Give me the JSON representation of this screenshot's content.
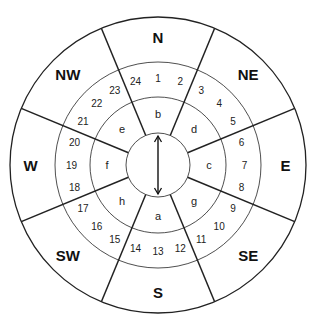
{
  "diagram": {
    "center": {
      "x": 158,
      "y": 165
    },
    "radii": {
      "outer": 148,
      "ring_numbers": 103,
      "ring_letters": 68,
      "inner": 32
    },
    "compass_sectors": [
      {
        "label": "N",
        "angle": 0
      },
      {
        "label": "NE",
        "angle": 45
      },
      {
        "label": "E",
        "angle": 90
      },
      {
        "label": "SE",
        "angle": 135
      },
      {
        "label": "S",
        "angle": 180
      },
      {
        "label": "SW",
        "angle": 225
      },
      {
        "label": "W",
        "angle": 270
      },
      {
        "label": "NW",
        "angle": 315
      }
    ],
    "numbered_positions": [
      "1",
      "2",
      "3",
      "4",
      "5",
      "6",
      "7",
      "8",
      "9",
      "10",
      "11",
      "12",
      "13",
      "14",
      "15",
      "16",
      "17",
      "18",
      "19",
      "20",
      "21",
      "22",
      "23",
      "24"
    ],
    "letter_segments": [
      {
        "label": "b",
        "sector": "N"
      },
      {
        "label": "d",
        "sector": "NE"
      },
      {
        "label": "c",
        "sector": "E"
      },
      {
        "label": "g",
        "sector": "SE"
      },
      {
        "label": "a",
        "sector": "S"
      },
      {
        "label": "h",
        "sector": "SW"
      },
      {
        "label": "f",
        "sector": "W"
      },
      {
        "label": "e",
        "sector": "NW"
      }
    ],
    "center_arrow": "double-headed vertical arrow"
  }
}
